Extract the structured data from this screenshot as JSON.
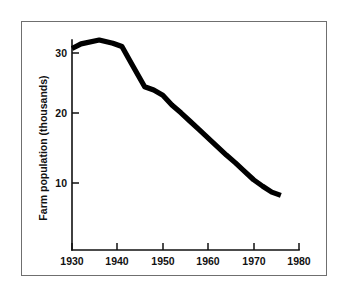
{
  "figure": {
    "background_color": "#ffffff",
    "frame_color": "#6f6f6f",
    "line_color": "#000000"
  },
  "chart_data": {
    "type": "line",
    "title": "",
    "subtitle": "",
    "xlabel": "",
    "ylabel": "Farm population (thousands)",
    "xlim": [
      1930,
      1980
    ],
    "ylim": [
      0,
      33
    ],
    "xticks": [
      1930,
      1940,
      1950,
      1960,
      1970,
      1980
    ],
    "xtick_labels": [
      "1930",
      "1940",
      "1950",
      "1960",
      "1970",
      "1980"
    ],
    "yticks": [
      10,
      20,
      30
    ],
    "ytick_labels": [
      "10",
      "20",
      "30"
    ],
    "grid": false,
    "legend": null,
    "legend_position": "none",
    "annotations": [],
    "series": [
      {
        "name": "Farm population",
        "color": "#000000",
        "line_width": 5,
        "x": [
          1930,
          1932,
          1936,
          1939,
          1941,
          1943,
          1946,
          1948,
          1950,
          1952,
          1954,
          1956,
          1958,
          1960,
          1962,
          1964,
          1966,
          1968,
          1970,
          1972,
          1974,
          1976
        ],
        "values": [
          30.7,
          31.4,
          32.0,
          31.5,
          31.0,
          28.5,
          24.8,
          24.3,
          23.5,
          22.0,
          20.8,
          19.5,
          18.2,
          16.9,
          15.6,
          14.3,
          13.1,
          11.8,
          10.5,
          9.5,
          8.6,
          8.1
        ]
      }
    ]
  },
  "y_axis": {
    "label": "Farm population (thousands)",
    "tick_labels": [
      "30",
      "20",
      "10"
    ]
  },
  "x_axis": {
    "label": "",
    "tick_labels": [
      "1930",
      "1940",
      "1950",
      "1960",
      "1970",
      "1980"
    ]
  }
}
